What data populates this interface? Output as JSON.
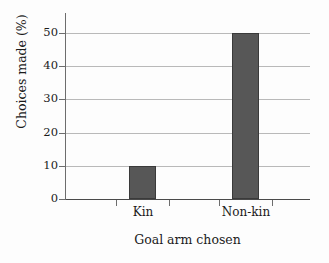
{
  "chart_data": {
    "type": "bar",
    "title": "",
    "subtitle": "",
    "xlabel": "Goal arm chosen",
    "ylabel": "Choices made (%)",
    "categories": [
      "Kin",
      "Non-kin"
    ],
    "values": [
      10,
      50
    ],
    "series": [
      {
        "name": "Choices made",
        "values": [
          10,
          50
        ]
      }
    ],
    "ylim": [
      0,
      50
    ],
    "yticks": [
      0,
      10,
      20,
      30,
      40,
      50
    ],
    "ytick_labels": [
      "0",
      "10",
      "20",
      "30",
      "40",
      "50"
    ],
    "xtick_labels": [
      "Kin",
      "Non-kin"
    ],
    "grid": "horizontal",
    "legend": "none",
    "annotations": [],
    "colors": {
      "bar_fill": "#575757",
      "bar_edge": "#3a3a3a",
      "gridline": "#b9b9b9",
      "axis": "#4a4a4a",
      "text": "#1b1b1b",
      "background": "#fdfdfd"
    }
  }
}
